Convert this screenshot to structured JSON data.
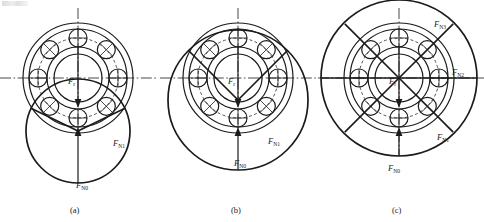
{
  "figure": {
    "background_color": "#ffffff",
    "line_color": "#1b1b1b",
    "panel_count": 3,
    "ball_count": 8
  },
  "panels": [
    {
      "id": "a",
      "caption": "(a)",
      "center": {
        "x": 78,
        "y": 78
      },
      "load_zone_degrees": 180,
      "center_label": "F",
      "center_sub": "r",
      "labels": [
        {
          "name": "force-n0",
          "base": "F",
          "sub": "N0",
          "x": 82,
          "y": 185
        },
        {
          "name": "force-n1",
          "base": "F",
          "sub": "N1",
          "x": 117,
          "y": 143
        }
      ]
    },
    {
      "id": "b",
      "caption": "(b)",
      "center": {
        "x": 238,
        "y": 78
      },
      "load_zone_degrees": 240,
      "center_label": "F",
      "center_sub": "r",
      "labels": [
        {
          "name": "force-n0",
          "base": "F",
          "sub": "N0",
          "x": 239,
          "y": 163
        },
        {
          "name": "force-n1",
          "base": "F",
          "sub": "N1",
          "x": 272,
          "y": 141
        }
      ]
    },
    {
      "id": "c",
      "caption": "(c)",
      "center": {
        "x": 399,
        "y": 78
      },
      "load_zone_degrees": 360,
      "center_label": "F",
      "center_sub": "r",
      "labels": [
        {
          "name": "force-n0",
          "base": "F",
          "sub": "N0",
          "x": 394,
          "y": 168
        },
        {
          "name": "force-n1",
          "base": "F",
          "sub": "N1",
          "x": 442,
          "y": 137
        },
        {
          "name": "force-n2",
          "base": "F",
          "sub": "N2",
          "x": 455,
          "y": 72
        },
        {
          "name": "force-n3",
          "base": "F",
          "sub": "N3",
          "x": 438,
          "y": 24
        }
      ]
    }
  ],
  "captions": {
    "a": "(a)",
    "b": "(b)",
    "c": "(c)"
  },
  "force_symbols": {
    "radial": {
      "base": "F",
      "sub": "r"
    },
    "n0": {
      "base": "F",
      "sub": "N0"
    },
    "n1": {
      "base": "F",
      "sub": "N1"
    },
    "n2": {
      "base": "F",
      "sub": "N2"
    },
    "n3": {
      "base": "F",
      "sub": "N3"
    }
  }
}
